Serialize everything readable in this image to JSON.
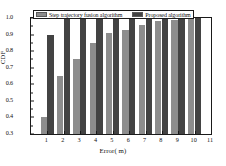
{
  "chart_data": {
    "type": "bar",
    "title": "",
    "xlabel": "Error( m)",
    "ylabel": "CDF",
    "categories": [
      "1",
      "2",
      "3",
      "4",
      "5",
      "6",
      "7",
      "8",
      "9",
      "10"
    ],
    "series": [
      {
        "name": "Step trajectory fusion algorithm",
        "color": "#8d8d8d",
        "values": [
          0.4,
          0.65,
          0.75,
          0.85,
          0.91,
          0.93,
          0.96,
          0.985,
          0.99,
          1.0
        ]
      },
      {
        "name": "Proposed algorithm",
        "color": "#434343",
        "values": [
          0.9,
          1.0,
          1.0,
          1.0,
          1.0,
          1.0,
          1.0,
          1.0,
          1.0,
          1.0
        ]
      }
    ],
    "ylim": [
      0.3,
      1.0
    ],
    "yticks": [
      "0.3",
      "0.4",
      "0.5",
      "0.6",
      "0.7",
      "0.8",
      "0.9",
      "1.0"
    ],
    "xlim": [
      0,
      11
    ],
    "xticks": [
      "1",
      "2",
      "3",
      "4",
      "5",
      "6",
      "7",
      "8",
      "9",
      "10",
      "11"
    ],
    "grid": false,
    "legend_position": "top"
  },
  "legend": {
    "entries": [
      {
        "label": "Step trajectory fusion algorithm",
        "color": "#8d8d8d"
      },
      {
        "label": "Proposed algorithm",
        "color": "#434343"
      }
    ]
  }
}
